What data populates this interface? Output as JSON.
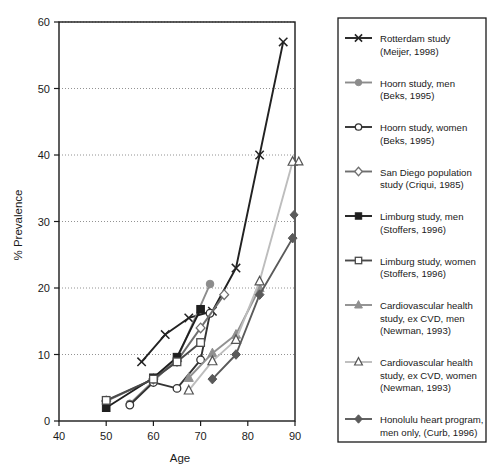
{
  "chart_data": {
    "type": "line",
    "title": "",
    "xlabel": "Age",
    "ylabel": "% Prevalence",
    "xlim": [
      40,
      90
    ],
    "ylim": [
      0,
      60
    ],
    "xticks": [
      40,
      50,
      60,
      70,
      80,
      90
    ],
    "yticks": [
      0,
      10,
      20,
      30,
      40,
      50,
      60
    ],
    "grid": "horizontal-dotted",
    "legend_position": "right",
    "series": [
      {
        "name": "Rotterdam study (Meijer, 1998)",
        "label_line1": "Rotterdam study",
        "label_line2": "(Meijer, 1998)",
        "marker": "x-cross",
        "color": "#222222",
        "x": [
          57.5,
          62.5,
          67.5,
          72.5,
          77.5,
          82.5,
          87.5
        ],
        "y": [
          8.9,
          13.0,
          15.5,
          16.5,
          23.0,
          40.0,
          57.0
        ]
      },
      {
        "name": "Hoorn study, men (Beks, 1995)",
        "label_line1": "Hoorn study, men",
        "label_line2": "(Beks, 1995)",
        "marker": "filled-circle",
        "color": "#8c8c8c",
        "x": [
          55,
          60,
          65,
          72
        ],
        "y": [
          2.6,
          6.0,
          9.3,
          20.6
        ]
      },
      {
        "name": "Hoorn study, women (Beks, 1995)",
        "label_line1": "Hoorn study, women",
        "label_line2": "(Beks, 1995)",
        "marker": "open-circle",
        "color": "#333333",
        "x": [
          55,
          60,
          65,
          70,
          72
        ],
        "y": [
          2.4,
          5.8,
          4.9,
          9.2,
          16.2
        ]
      },
      {
        "name": "San Diego population study (Criqui, 1985)",
        "label_line1": "San Diego population",
        "label_line2": "study (Criqui, 1985)",
        "marker": "open-diamond",
        "color": "#6f6f6f",
        "x": [
          50,
          60,
          65,
          70,
          75
        ],
        "y": [
          3.0,
          6.3,
          9.0,
          14.0,
          19.0
        ]
      },
      {
        "name": "Limburg study, men (Stoffers, 1996)",
        "label_line1": "Limburg study, men",
        "label_line2": "(Stoffers, 1996)",
        "marker": "filled-square",
        "color": "#1f1f1f",
        "x": [
          50,
          60,
          65,
          70
        ],
        "y": [
          2.0,
          6.5,
          9.6,
          16.8
        ]
      },
      {
        "name": "Limburg study, women (Stoffers, 1996)",
        "label_line1": "Limburg study, women",
        "label_line2": "(Stoffers, 1996)",
        "marker": "open-square",
        "color": "#4a4a4a",
        "x": [
          50,
          60,
          65,
          70
        ],
        "y": [
          3.1,
          6.3,
          8.9,
          11.8
        ]
      },
      {
        "name": "Cardiovascular health study, ex CVD, men (Newman, 1993)",
        "label_line1": "Cardiovascular health",
        "label_line2": "study, ex CVD, men",
        "label_line3": "(Newman, 1993)",
        "marker": "filled-triangle",
        "color": "#909090",
        "x": [
          67.5,
          72.5,
          77.5,
          82.5
        ],
        "y": [
          6.5,
          10.2,
          13.0,
          20.0
        ]
      },
      {
        "name": "Cardiovascular health study, ex CVD, women (Newman, 1993)",
        "label_line1": "Cardiovascular health",
        "label_line2": "study, ex CVD, women",
        "label_line3": "(Newman, 1993)",
        "marker": "open-triangle",
        "color": "#bdbdbd",
        "x": [
          67.5,
          72.5,
          77.5,
          82.5,
          89.5
        ],
        "y": [
          4.6,
          9.0,
          12.2,
          21.0,
          39.0
        ]
      },
      {
        "name": "Honolulu heart program, men only, (Curb, 1996)",
        "label_line1": "Honolulu heart program,",
        "label_line2": "men only, (Curb, 1996)",
        "marker": "filled-diamond",
        "color": "#5a5a5a",
        "x": [
          72.5,
          77.5,
          82.5,
          89.5
        ],
        "y": [
          6.3,
          10.0,
          19.0,
          27.5
        ]
      }
    ],
    "extra_markers": [
      {
        "name": "open-triangle-right-edge",
        "marker": "open-triangle",
        "x": 90.8,
        "y": 39.0,
        "color": "#555555"
      },
      {
        "name": "honolulu-upper-endpoint",
        "marker": "filled-diamond",
        "x": 89.8,
        "y": 31.0,
        "color": "#5a5a5a"
      }
    ]
  }
}
